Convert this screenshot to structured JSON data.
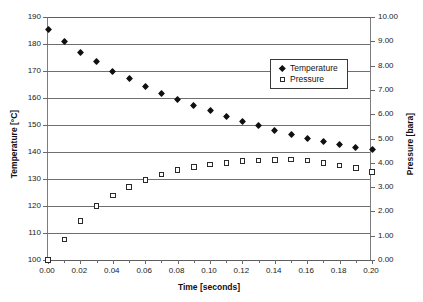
{
  "chart_data": {
    "type": "scatter",
    "title": "",
    "xlabel": "Time [seconds]",
    "ylabel": "Temperature [°C]",
    "y2label": "Pressure [bara]",
    "xlim": [
      0.0,
      0.2
    ],
    "ylim": [
      100,
      190
    ],
    "y2lim": [
      0.0,
      10.0
    ],
    "xticks": [
      "0.00",
      "0.02",
      "0.04",
      "0.06",
      "0.08",
      "0.10",
      "0.12",
      "0.14",
      "0.16",
      "0.18",
      "0.20"
    ],
    "yticks": [
      "100",
      "110",
      "120",
      "130",
      "140",
      "150",
      "160",
      "170",
      "180",
      "190"
    ],
    "y2ticks": [
      "0.00",
      "1.00",
      "2.00",
      "3.00",
      "4.00",
      "5.00",
      "6.00",
      "7.00",
      "8.00",
      "9.00",
      "10.00"
    ],
    "grid": "horizontal",
    "legend_position": "upper-right",
    "x": [
      0.0,
      0.01,
      0.02,
      0.03,
      0.04,
      0.05,
      0.06,
      0.07,
      0.08,
      0.09,
      0.1,
      0.11,
      0.12,
      0.13,
      0.14,
      0.15,
      0.16,
      0.17,
      0.18,
      0.19,
      0.2
    ],
    "series": [
      {
        "name": "Temperature",
        "axis": "left",
        "units": "°C",
        "marker": "filled-diamond",
        "color": "#101010",
        "values": [
          185.5,
          181.0,
          177.0,
          173.4,
          170.0,
          167.2,
          164.4,
          161.8,
          159.6,
          157.4,
          155.3,
          153.0,
          151.2,
          149.7,
          148.1,
          146.5,
          145.1,
          144.0,
          142.8,
          141.8,
          140.8
        ]
      },
      {
        "name": "Pressure",
        "axis": "right",
        "units": "bara",
        "marker": "open-square",
        "color": "#2a2a2a",
        "values": [
          0.0,
          0.85,
          1.6,
          2.22,
          2.66,
          3.0,
          3.3,
          3.52,
          3.7,
          3.83,
          3.93,
          4.0,
          4.07,
          4.1,
          4.12,
          4.14,
          4.1,
          4.0,
          3.9,
          3.78,
          3.62
        ]
      }
    ]
  },
  "legend": {
    "entries": [
      {
        "label": "Temperature",
        "marker": "filled-diamond"
      },
      {
        "label": "Pressure",
        "marker": "open-square"
      }
    ]
  }
}
